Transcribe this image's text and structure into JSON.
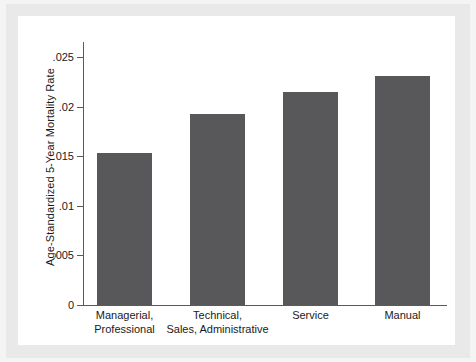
{
  "chart_data": {
    "type": "bar",
    "title": "",
    "xlabel": "",
    "ylabel": "Age-Standardized 5-Year Mortality Rate",
    "categories": [
      "Managerial, Professional",
      "Technical, Sales, Administrative",
      "Service",
      "Manual"
    ],
    "category_lines": [
      [
        "Managerial,",
        "Professional"
      ],
      [
        "Technical,",
        "Sales, Administrative"
      ],
      [
        "Service",
        ""
      ],
      [
        "Manual",
        ""
      ]
    ],
    "values": [
      0.0153,
      0.0192,
      0.0215,
      0.0231
    ],
    "ylim": [
      0,
      0.0265
    ],
    "ytick_values": [
      0,
      0.005,
      0.01,
      0.015,
      0.02,
      0.025
    ],
    "ytick_labels": [
      "0",
      ".005",
      ".01",
      ".015",
      ".02",
      ".025"
    ],
    "grid": false,
    "legend": null,
    "bar_color": "#58585a",
    "axis_color": "#5a5a5a",
    "plot_background": "#ffffff",
    "page_background": "#f2f2f2"
  }
}
